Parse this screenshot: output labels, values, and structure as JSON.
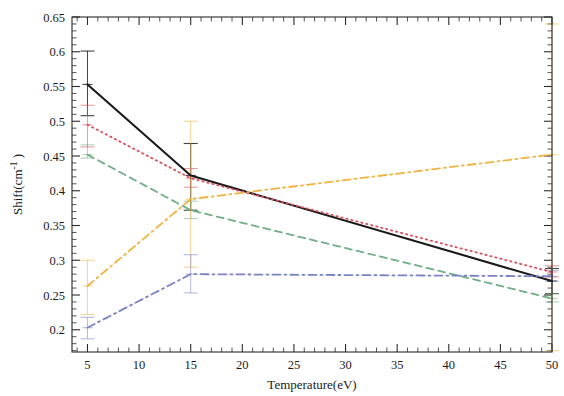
{
  "chart_data": {
    "type": "line",
    "title": "",
    "xlabel": "Temperature(eV)",
    "ylabel": "Shift(cm",
    "ylabel_sup": "-1",
    "ylabel_tail": " )",
    "x": [
      5,
      15,
      50
    ],
    "xlim": [
      3.5,
      50
    ],
    "ylim": [
      0.168,
      0.65
    ],
    "xticks": [
      5,
      10,
      15,
      20,
      25,
      30,
      35,
      40,
      45,
      50
    ],
    "xtick_labels": [
      "5",
      "10",
      "15",
      "20",
      "25",
      "30",
      "35",
      "40",
      "45",
      "50"
    ],
    "yticks": [
      0.2,
      0.25,
      0.3,
      0.35,
      0.4,
      0.45,
      0.5,
      0.55,
      0.6,
      0.65
    ],
    "ytick_labels": [
      "0.2",
      "0.25",
      "0.3",
      "0.35",
      "0.4",
      "0.45",
      "0.5",
      "0.55",
      "0.6",
      "0.65"
    ],
    "grid": false,
    "legend": "none",
    "minor_ticks_x": 5,
    "minor_ticks_y": 5,
    "series": [
      {
        "name": "series-black-solid",
        "color": "#1a1a1a",
        "style": "solid",
        "width": 2.1,
        "values": [
          0.553,
          0.422,
          0.27
        ],
        "err_low": [
          0.508,
          0.372,
          0.252
        ],
        "err_high": [
          0.601,
          0.468,
          0.288
        ],
        "has_errorbars": true
      },
      {
        "name": "series-red-dotted",
        "color": "#d94f5c",
        "style": "dotted",
        "width": 1.8,
        "values": [
          0.495,
          0.418,
          0.283
        ],
        "err_low": [
          0.463,
          0.405,
          0.276
        ],
        "err_high": [
          0.523,
          0.432,
          0.292
        ],
        "has_errorbars": true
      },
      {
        "name": "series-green-dashed",
        "color": "#6fae86",
        "style": "dashed",
        "width": 1.8,
        "values": [
          0.452,
          0.372,
          0.245
        ],
        "err_low": [
          0.447,
          0.36,
          0.24
        ],
        "err_high": [
          0.466,
          0.385,
          0.252
        ],
        "has_errorbars": true
      },
      {
        "name": "series-orange-dashdot",
        "color": "#f0b341",
        "style": "dashdot",
        "width": 1.8,
        "values": [
          0.263,
          0.388,
          0.452
        ],
        "err_low": [
          0.222,
          0.29,
          0.17
        ],
        "err_high": [
          0.3,
          0.5,
          0.64
        ],
        "has_errorbars": true
      },
      {
        "name": "series-blue-dashdot",
        "color": "#7b82c4",
        "style": "dashdot",
        "width": 1.8,
        "values": [
          0.203,
          0.28,
          0.277
        ],
        "err_low": [
          0.187,
          0.253,
          0.27
        ],
        "err_high": [
          0.218,
          0.308,
          0.285
        ],
        "has_errorbars": true
      }
    ]
  }
}
